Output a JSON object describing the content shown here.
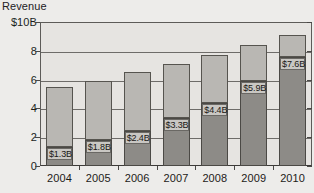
{
  "chart_data": {
    "type": "bar",
    "subtype": "stacked-vertical",
    "title": "",
    "axis_title": "Revenue",
    "xlabel": "",
    "ylabel": "Revenue",
    "ylim": [
      0,
      10
    ],
    "y_unit": "$B",
    "grid": true,
    "legend": "none",
    "categories": [
      "2004",
      "2005",
      "2006",
      "2007",
      "2008",
      "2009",
      "2010"
    ],
    "ytick_labels": [
      "$10B",
      "8",
      "6",
      "4",
      "2",
      "0"
    ],
    "ytick_values": [
      10,
      8,
      6,
      4,
      2,
      0
    ],
    "series": [
      {
        "name": "lower-segment",
        "color": "#8d8b87",
        "values": [
          1.3,
          1.8,
          2.4,
          3.3,
          4.4,
          5.9,
          7.6
        ],
        "labels": [
          "$1.3B",
          "$1.8B",
          "$2.4B",
          "$3.3B",
          "$4.4B",
          "$5.9B",
          "$7.6B"
        ]
      },
      {
        "name": "upper-segment",
        "color": "#b9b7b3",
        "values": [
          4.2,
          4.1,
          4.1,
          3.8,
          3.3,
          2.5,
          1.5
        ]
      }
    ],
    "totals": [
      5.5,
      5.9,
      6.5,
      7.1,
      7.7,
      8.4,
      9.1
    ]
  },
  "colors": {
    "background": "#edecea",
    "plot_background": "#e6e4e1",
    "segment_lower": "#8d8b87",
    "segment_upper": "#b9b7b3",
    "gridline": "#6e6c69",
    "axis": "#4a4846",
    "text": "#1d1b19",
    "label_background": "#c9c7c3"
  }
}
